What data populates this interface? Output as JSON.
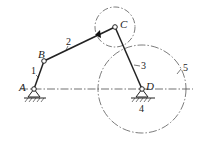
{
  "diagram": {
    "type": "four-bar linkage mechanism",
    "points": {
      "A": {
        "label": "A",
        "x": 34,
        "y": 89
      },
      "B": {
        "label": "B",
        "x": 44,
        "y": 61
      },
      "C": {
        "label": "C",
        "x": 115,
        "y": 27
      },
      "D": {
        "label": "D",
        "x": 142,
        "y": 89
      }
    },
    "members": [
      {
        "id": "1",
        "label": "1",
        "from": "A",
        "to": "B"
      },
      {
        "id": "2",
        "label": "2",
        "from": "B",
        "to": "C"
      },
      {
        "id": "3",
        "label": "3",
        "from": "C",
        "to": "D"
      },
      {
        "id": "4",
        "label": "4",
        "desc": "ground at D"
      },
      {
        "id": "5",
        "label": "5",
        "desc": "circle centered at D"
      }
    ],
    "circles": [
      {
        "center": "C",
        "radius": 20,
        "style": "dash-dot"
      },
      {
        "center": "D",
        "radius": 44,
        "style": "dash-dot"
      }
    ],
    "centerline": {
      "y": 89,
      "x1": 20,
      "x2": 193,
      "style": "dash-dot"
    },
    "colors": {
      "line": "#222222",
      "background": "#ffffff"
    }
  }
}
